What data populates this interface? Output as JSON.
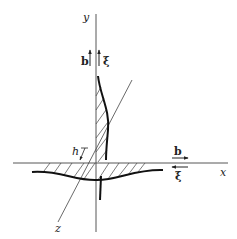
{
  "diagram": {
    "type": "dislocation-loop-cross-section",
    "axes": {
      "x_label": "x",
      "y_label": "y",
      "z_label": "z"
    },
    "labels": {
      "h": "h",
      "b_vertical": "b",
      "xi_vertical": "ξ",
      "b_horizontal": "b",
      "xi_horizontal": "ξ"
    },
    "colors": {
      "line": "#333333",
      "curve": "#111111",
      "background": "#ffffff"
    }
  }
}
